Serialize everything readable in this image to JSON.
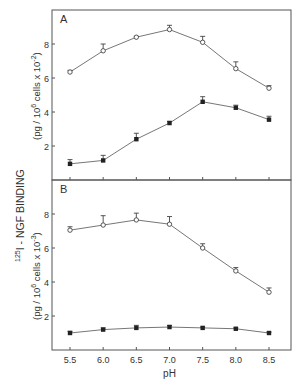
{
  "figure": {
    "shared_ylabel": "125I - NGF BINDING",
    "xlabel": "pH",
    "x_ticks": [
      "5.5",
      "6.0",
      "6.5",
      "7.0",
      "7.5",
      "8.0",
      "8.5"
    ]
  },
  "chart_data": [
    {
      "type": "line",
      "panel": "A",
      "title": "",
      "xlabel": "pH",
      "ylabel": "(pg / 10^6 cells x 10^-2)",
      "x": [
        5.5,
        6.0,
        6.5,
        7.0,
        7.5,
        8.0,
        8.5
      ],
      "xlim": [
        5.28,
        8.86
      ],
      "ylim": [
        0,
        10
      ],
      "y_ticks": [
        2,
        4,
        6,
        8
      ],
      "grid": false,
      "series": [
        {
          "name": "open circles",
          "marker": "open-circle",
          "values": [
            6.35,
            7.6,
            8.4,
            8.85,
            8.1,
            6.55,
            5.4
          ],
          "errors": [
            0.1,
            0.4,
            0.05,
            0.25,
            0.35,
            0.4,
            0.15
          ]
        },
        {
          "name": "filled circles",
          "marker": "filled-circle",
          "values": [
            0.95,
            1.15,
            2.4,
            3.35,
            4.6,
            4.25,
            3.55
          ],
          "errors": [
            0.25,
            0.3,
            0.35,
            0.1,
            0.3,
            0.15,
            0.2
          ]
        }
      ]
    },
    {
      "type": "line",
      "panel": "B",
      "title": "",
      "xlabel": "pH",
      "ylabel": "(pg / 10^6 cells x 10^-3)",
      "x": [
        5.5,
        6.0,
        6.5,
        7.0,
        7.5,
        8.0,
        8.5
      ],
      "xlim": [
        5.28,
        8.86
      ],
      "ylim": [
        0,
        10
      ],
      "y_ticks": [
        2,
        4,
        6,
        8
      ],
      "grid": false,
      "series": [
        {
          "name": "open circles",
          "marker": "open-circle",
          "values": [
            7.05,
            7.35,
            7.65,
            7.4,
            6.0,
            4.65,
            3.4
          ],
          "errors": [
            0.2,
            0.55,
            0.4,
            0.45,
            0.25,
            0.2,
            0.25
          ]
        },
        {
          "name": "filled circles",
          "marker": "filled-circle",
          "values": [
            1.0,
            1.2,
            1.3,
            1.35,
            1.3,
            1.25,
            1.0
          ],
          "errors": [
            0.1,
            0.1,
            0.15,
            0.1,
            0.05,
            0.05,
            0.05
          ]
        }
      ]
    }
  ],
  "panels": [
    {
      "label": "A",
      "ylabel_main": "(pg / 10",
      "ylabel_sup1": "6",
      "ylabel_mid": " cells x 10",
      "ylabel_sup2": "-2",
      "ylabel_end": ")"
    },
    {
      "label": "B",
      "ylabel_main": "(pg / 10",
      "ylabel_sup1": "6",
      "ylabel_mid": " cells x 10",
      "ylabel_sup2": "-3",
      "ylabel_end": ")"
    }
  ],
  "shared_label_parts": {
    "sup": "125",
    "rest": "I - NGF BINDING"
  }
}
